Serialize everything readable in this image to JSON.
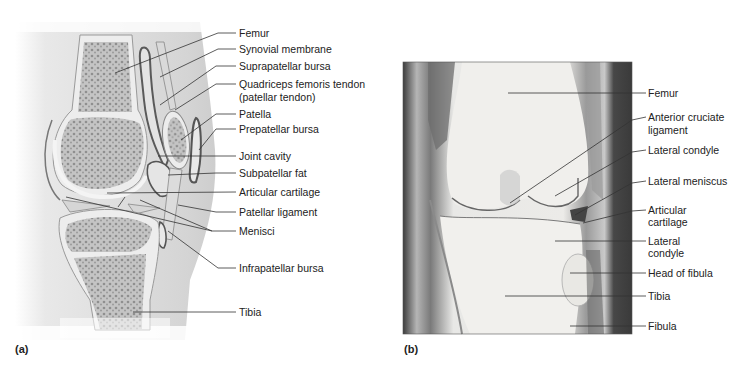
{
  "figure": {
    "panel_a": {
      "tag": "(a)",
      "description": "Sagittal section illustration of knee joint",
      "labels": [
        {
          "id": "femur",
          "text": "Femur",
          "x": 238,
          "y": 27
        },
        {
          "id": "synovial-membrane",
          "text": "Synovial membrane",
          "x": 238,
          "y": 43
        },
        {
          "id": "suprapatellar-bursa",
          "text": "Suprapatellar bursa",
          "x": 238,
          "y": 60
        },
        {
          "id": "quadriceps-tendon",
          "text": "Quadriceps femoris tendon",
          "text2": "(patellar tendon)",
          "x": 238,
          "y": 78
        },
        {
          "id": "patella",
          "text": "Patella",
          "x": 238,
          "y": 108
        },
        {
          "id": "prepatellar-bursa",
          "text": "Prepatellar bursa",
          "x": 238,
          "y": 123
        },
        {
          "id": "joint-cavity",
          "text": "Joint cavity",
          "x": 238,
          "y": 150
        },
        {
          "id": "subpatellar-fat",
          "text": "Subpatellar fat",
          "x": 238,
          "y": 167
        },
        {
          "id": "articular-cartilage",
          "text": "Articular cartilage",
          "x": 238,
          "y": 186
        },
        {
          "id": "patellar-ligament",
          "text": "Patellar ligament",
          "x": 238,
          "y": 206
        },
        {
          "id": "menisci",
          "text": "Menisci",
          "x": 238,
          "y": 225
        },
        {
          "id": "infrapatellar-bursa",
          "text": "Infrapatellar bursa",
          "x": 238,
          "y": 262
        },
        {
          "id": "tibia",
          "text": "Tibia",
          "x": 238,
          "y": 306
        }
      ]
    },
    "panel_b": {
      "tag": "(b)",
      "description": "Frontal section photograph of knee joint",
      "labels": [
        {
          "id": "femur",
          "text": "Femur",
          "x": 648,
          "y": 87
        },
        {
          "id": "anterior-cruciate-ligament",
          "text": "Anterior cruciate",
          "text2": "ligament",
          "x": 648,
          "y": 111
        },
        {
          "id": "lateral-condyle-femur",
          "text": "Lateral condyle",
          "x": 648,
          "y": 144
        },
        {
          "id": "lateral-meniscus",
          "text": "Lateral meniscus",
          "x": 648,
          "y": 175
        },
        {
          "id": "articular-cartilage",
          "text": "Articular",
          "text2": "cartilage",
          "x": 648,
          "y": 204
        },
        {
          "id": "lateral-condyle-tibia",
          "text": "Lateral",
          "text2": "condyle",
          "x": 648,
          "y": 235
        },
        {
          "id": "head-of-fibula",
          "text": "Head of fibula",
          "x": 648,
          "y": 267
        },
        {
          "id": "tibia",
          "text": "Tibia",
          "x": 648,
          "y": 290
        },
        {
          "id": "fibula",
          "text": "Fibula",
          "x": 648,
          "y": 320
        }
      ]
    }
  },
  "labels_a": {
    "femur": "Femur",
    "synovial_membrane": "Synovial membrane",
    "suprapatellar_bursa": "Suprapatellar bursa",
    "quadriceps_1": "Quadriceps femoris tendon",
    "quadriceps_2": "(patellar tendon)",
    "patella": "Patella",
    "prepatellar_bursa": "Prepatellar bursa",
    "joint_cavity": "Joint cavity",
    "subpatellar_fat": "Subpatellar fat",
    "articular_cartilage": "Articular cartilage",
    "patellar_ligament": "Patellar ligament",
    "menisci": "Menisci",
    "infrapatellar_bursa": "Infrapatellar bursa",
    "tibia": "Tibia",
    "tag": "(a)"
  },
  "labels_b": {
    "femur": "Femur",
    "acl_1": "Anterior cruciate",
    "acl_2": "ligament",
    "lateral_condyle": "Lateral condyle",
    "lateral_meniscus": "Lateral meniscus",
    "articular_1": "Articular",
    "articular_2": "cartilage",
    "lateral_2a": "Lateral",
    "lateral_2b": "condyle",
    "head_of_fibula": "Head of fibula",
    "tibia": "Tibia",
    "fibula": "Fibula",
    "tag": "(b)"
  },
  "colors": {
    "background": "#ffffff",
    "bone_fill": "#bdbdbd",
    "cartilage": "#ececec",
    "soft_tissue": "#d6d6d6",
    "bursa_outline": "#555555",
    "photo_dark": "#3a3a3a",
    "leader_line": "#333333"
  }
}
